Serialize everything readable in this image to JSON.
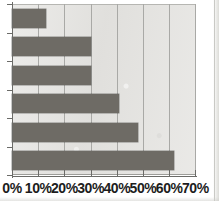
{
  "chart_data": {
    "type": "bar",
    "orientation": "horizontal",
    "title": "",
    "subtitle": "",
    "xlabel": "",
    "ylabel": "",
    "categories": [
      "",
      "",
      "",
      "",
      "",
      ""
    ],
    "values": [
      13,
      30,
      30,
      41,
      48,
      62
    ],
    "value_unit": "%",
    "xlim": [
      0,
      70
    ],
    "ylim": [
      0,
      6
    ],
    "x_ticks": [
      0,
      10,
      20,
      30,
      40,
      50,
      60,
      70
    ],
    "x_tick_labels": [
      "0%",
      "10%",
      "20%",
      "30%",
      "40%",
      "50%",
      "60%",
      "70%"
    ],
    "y_tick_labels": [],
    "grid": true,
    "grid_axis": "x",
    "legend": false,
    "legend_position": "none",
    "series": [
      {
        "name": "Series 1",
        "values": [
          13,
          30,
          30,
          41,
          48,
          62
        ]
      }
    ],
    "annotations": []
  },
  "style": {
    "bar_color": "#6e6b65",
    "plot_background": "#e4e3e0",
    "gridline_color": "#a9a9a6",
    "axis_color": "#6b6b68",
    "tick_label_color": "#1d1d1d",
    "page_background": "#ffffff"
  }
}
